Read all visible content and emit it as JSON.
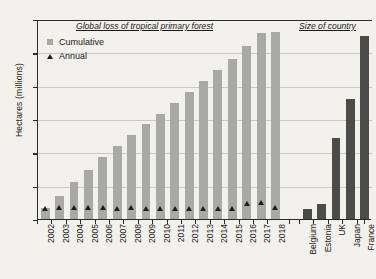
{
  "chart_data": {
    "type": "bar",
    "title": "",
    "panel_titles": {
      "left": "Global loss of tropical primary forest",
      "right": "Size of country"
    },
    "ylabel": "Hectares (millions)",
    "xlabel": "",
    "ylim": [
      0,
      60
    ],
    "yticks": [
      0,
      10,
      20,
      30,
      40,
      50,
      60
    ],
    "ytick_labels": [
      "0",
      "10",
      "20",
      "30",
      "40",
      "50",
      "60"
    ],
    "grid": true,
    "legend": {
      "position": "top-left",
      "entries": [
        {
          "label": "Cumulative",
          "marker": "square",
          "color": "#a9a9a6"
        },
        {
          "label": "Annual",
          "marker": "triangle",
          "color": "#1d1d1d"
        }
      ]
    },
    "categories": [
      "2002",
      "2003",
      "2004",
      "2005",
      "2006",
      "2007",
      "2008",
      "2009",
      "2010",
      "2011",
      "2012",
      "2013",
      "2014",
      "2015",
      "2016",
      "2017",
      "2018"
    ],
    "series": [
      {
        "name": "Cumulative",
        "color": "#a9a9a6",
        "values": [
          3.2,
          6.8,
          11.2,
          14.8,
          18.5,
          21.8,
          25.2,
          28.4,
          31.6,
          34.8,
          38.1,
          41.4,
          44.6,
          47.9,
          52.0,
          55.7,
          56.2
        ]
      },
      {
        "name": "Annual",
        "color": "#1d1d1d",
        "values": [
          3.2,
          3.6,
          3.5,
          3.6,
          3.4,
          3.3,
          3.4,
          3.2,
          3.2,
          3.2,
          3.3,
          3.3,
          3.2,
          3.3,
          4.8,
          5.0,
          3.4
        ]
      }
    ],
    "country_categories": [
      "Belgium",
      "Estonia",
      "UK",
      "Japan",
      "France"
    ],
    "country_series": {
      "name": "Size of country",
      "color": "#4b4b4b",
      "values": [
        3.0,
        4.5,
        24.3,
        36.0,
        55.0
      ]
    }
  }
}
